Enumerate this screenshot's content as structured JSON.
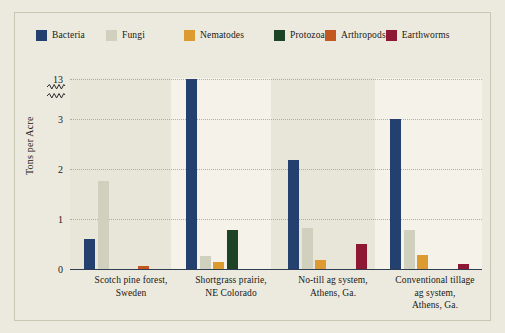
{
  "figure": {
    "background_color": "#eceade",
    "frame_color": "#c9c6b4",
    "plot_background_color": "#e8e6d9",
    "band_color": "#f4f2e9",
    "axis_color": "#2e3d52",
    "gridline_color": "#9aa7b0"
  },
  "legend": {
    "position": "top-left",
    "entries": [
      {
        "label": "Bacteria",
        "color": "#24406e",
        "icon": "legend-swatch-icon"
      },
      {
        "label": "Fungi",
        "color": "#cfd0bd",
        "icon": "legend-swatch-icon"
      },
      {
        "label": "Nematodes",
        "color": "#dd9a31",
        "icon": "legend-swatch-icon"
      },
      {
        "label": "Protozoa",
        "color": "#1e4426",
        "icon": "legend-swatch-icon"
      },
      {
        "label": "Arthropods",
        "color": "#c4561f",
        "icon": "legend-swatch-icon"
      },
      {
        "label": "Earthworms",
        "color": "#8e1733",
        "icon": "legend-swatch-icon"
      }
    ]
  },
  "axes": {
    "ylabel": "Tons per Acre",
    "ytick_labels": [
      "0",
      "1",
      "2",
      "3",
      "13"
    ],
    "break_marker": "zigzag",
    "break_between": [
      3,
      13
    ]
  },
  "chart_data": {
    "type": "bar",
    "title": "",
    "subtitle": "",
    "xlabel": "",
    "ylabel": "Tons per Acre",
    "ylim": [
      0,
      13.6
    ],
    "y_axis_break": {
      "lower_max": 3,
      "upper_min": 3,
      "upper_max": 13.6,
      "marker": "zigzag"
    },
    "yticks": [
      0,
      1,
      2,
      3,
      13
    ],
    "grid": true,
    "legend_position": "top-left",
    "categories": [
      "Scotch pine forest, Sweden",
      "Shortgrass prairie, NE Colorado",
      "No-till ag system, Athens, Ga.",
      "Conventional tillage ag system, Athens, Ga."
    ],
    "series": [
      {
        "name": "Bacteria",
        "color": "#24406e",
        "values": [
          0.63,
          13.3,
          2.2,
          3.4
        ]
      },
      {
        "name": "Fungi",
        "color": "#cfd0bd",
        "values": [
          1.78,
          0.28,
          0.85,
          0.8
        ]
      },
      {
        "name": "Nematodes",
        "color": "#dd9a31",
        "values": [
          0.02,
          0.16,
          0.21,
          0.3
        ]
      },
      {
        "name": "Protozoa",
        "color": "#1e4426",
        "values": [
          0.01,
          0.8,
          0.02,
          0.01
        ]
      },
      {
        "name": "Arthropods",
        "color": "#c4561f",
        "values": [
          0.08,
          0.02,
          0.01,
          0.03
        ]
      },
      {
        "name": "Earthworms",
        "color": "#8e1733",
        "values": [
          0.01,
          0.01,
          0.53,
          0.12
        ]
      }
    ]
  },
  "xlabels": [
    {
      "line1": "Scotch pine forest,",
      "line2": "Sweden",
      "line3": ""
    },
    {
      "line1": "Shortgrass prairie,",
      "line2": "NE Colorado",
      "line3": ""
    },
    {
      "line1": "No-till ag system,",
      "line2": "Athens, Ga.",
      "line3": ""
    },
    {
      "line1": "Conventional tillage",
      "line2": "ag system,",
      "line3": "Athens, Ga."
    }
  ]
}
